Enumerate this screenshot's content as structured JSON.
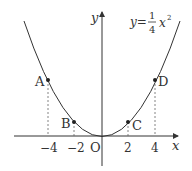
{
  "diagram": {
    "equation": {
      "prefix": "y=",
      "numerator": "1",
      "denominator": "4",
      "variable": "x",
      "exponent": "2"
    },
    "axes": {
      "x_label": "x",
      "y_label": "y",
      "origin_label": "O"
    },
    "x_ticks": [
      "−4",
      "−2",
      "2",
      "4"
    ],
    "points": [
      {
        "name": "A",
        "x": -4,
        "y": 4
      },
      {
        "name": "B",
        "x": -2,
        "y": 1
      },
      {
        "name": "C",
        "x": 2,
        "y": 1
      },
      {
        "name": "D",
        "x": 4,
        "y": 4
      }
    ],
    "colors": {
      "curve": "#333333",
      "axis": "#333333",
      "dashed": "#666666"
    }
  }
}
